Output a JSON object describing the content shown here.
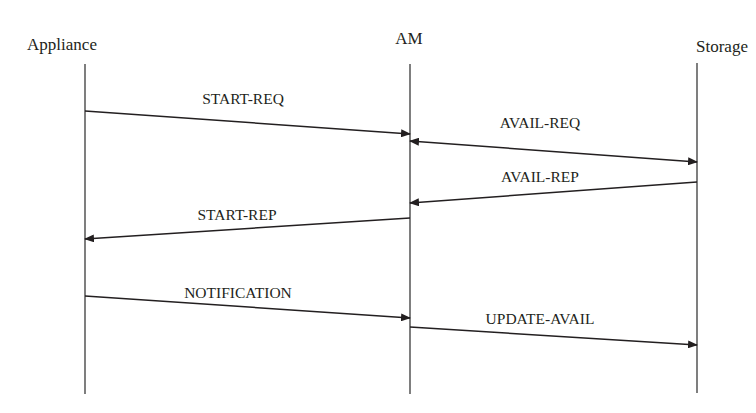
{
  "diagram": {
    "type": "sequence",
    "participants": [
      {
        "id": "appliance",
        "label": "Appliance",
        "x": 85,
        "label_x": 62,
        "label_y": 50,
        "top": 64,
        "bottom": 394
      },
      {
        "id": "am",
        "label": "AM",
        "x": 410,
        "label_x": 409,
        "label_y": 44,
        "top": 64,
        "bottom": 394
      },
      {
        "id": "storage",
        "label": "Storage",
        "x": 697,
        "label_x": 722,
        "label_y": 52,
        "top": 63,
        "bottom": 393
      }
    ],
    "messages": [
      {
        "label": "START-REQ",
        "from": "appliance",
        "to": "am",
        "x1": 85,
        "y1": 111,
        "x2": 410,
        "y2": 134,
        "label_x": 243,
        "label_y": 104
      },
      {
        "label": "AVAIL-REQ",
        "from": "am",
        "to": "storage",
        "x1": 410,
        "y1": 141,
        "x2": 697,
        "y2": 162,
        "label_x": 540,
        "label_y": 128,
        "bidirectional": true
      },
      {
        "label": "AVAIL-REP",
        "from": "storage",
        "to": "am",
        "x1": 697,
        "y1": 182,
        "x2": 410,
        "y2": 203,
        "label_x": 540,
        "label_y": 182
      },
      {
        "label": "START-REP",
        "from": "am",
        "to": "appliance",
        "x1": 410,
        "y1": 218,
        "x2": 85,
        "y2": 239,
        "label_x": 237,
        "label_y": 220
      },
      {
        "label": "NOTIFICATION",
        "from": "appliance",
        "to": "am",
        "x1": 85,
        "y1": 296,
        "x2": 410,
        "y2": 318,
        "label_x": 238,
        "label_y": 298
      },
      {
        "label": "UPDATE-AVAIL",
        "from": "am",
        "to": "storage",
        "x1": 410,
        "y1": 327,
        "x2": 697,
        "y2": 345,
        "label_x": 540,
        "label_y": 324
      }
    ],
    "colors": {
      "line": "#231f20",
      "lifeline": "#3a3a3a",
      "text": "#231f20",
      "background": "#ffffff"
    }
  }
}
